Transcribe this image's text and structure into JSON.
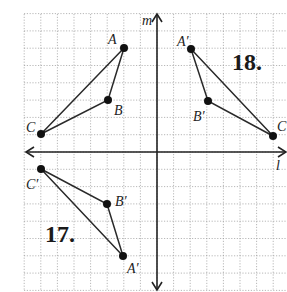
{
  "diagram": {
    "type": "coordinate-grid-reflections",
    "axes": {
      "vertical_label": "m",
      "horizontal_label": "l"
    },
    "grid": {
      "x_range": [
        -8,
        8
      ],
      "y_range": [
        -8,
        8
      ]
    },
    "figures": [
      {
        "id": "original",
        "points": [
          {
            "name": "A",
            "label": "A",
            "x": -2,
            "y": 6
          },
          {
            "name": "B",
            "label": "B",
            "x": -3,
            "y": 3
          },
          {
            "name": "C",
            "label": "C",
            "x": -7,
            "y": 1
          }
        ]
      },
      {
        "id": "problem-18",
        "number_label": "18.",
        "description": "reflection over line m",
        "points": [
          {
            "name": "A'",
            "label": "A′",
            "x": 2,
            "y": 6
          },
          {
            "name": "B'",
            "label": "B′",
            "x": 3,
            "y": 3
          },
          {
            "name": "C",
            "label": "C",
            "x": 7,
            "y": 1
          }
        ]
      },
      {
        "id": "problem-17",
        "number_label": "17.",
        "description": "reflection over line l",
        "points": [
          {
            "name": "C'",
            "label": "C′",
            "x": -7,
            "y": -1
          },
          {
            "name": "B'",
            "label": "B′",
            "x": -3,
            "y": -3
          },
          {
            "name": "A'",
            "label": "A′",
            "x": -2,
            "y": -6
          }
        ]
      }
    ]
  }
}
